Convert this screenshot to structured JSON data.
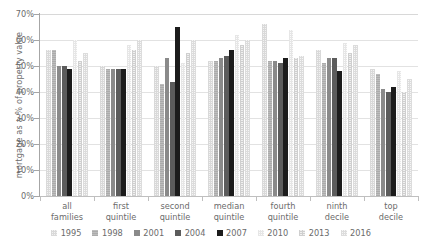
{
  "chart_data": {
    "type": "bar",
    "title": "",
    "xlabel": "",
    "ylabel": "mortgage as a % of property value",
    "ylim": [
      0,
      70
    ],
    "ytick_labels": [
      "70%",
      "60%",
      "50%",
      "40%",
      "30%",
      "20%",
      "10%",
      "0%"
    ],
    "ytick_values": [
      70,
      60,
      50,
      40,
      30,
      20,
      10,
      0
    ],
    "grid": true,
    "legend_position": "bottom",
    "categories": [
      "all families",
      "first quintile",
      "second quintile",
      "median quintile",
      "fourth quintile",
      "ninth decile",
      "top decile"
    ],
    "category_lines": [
      [
        "all",
        "families"
      ],
      [
        "first",
        "quintile"
      ],
      [
        "second",
        "quintile"
      ],
      [
        "median",
        "quintile"
      ],
      [
        "fourth",
        "quintile"
      ],
      [
        "ninth",
        "decile"
      ],
      [
        "top",
        "decile"
      ]
    ],
    "series": [
      {
        "name": "1995",
        "color": "#f2f2f2",
        "values": [
          56,
          50,
          50,
          52,
          66,
          56,
          49
        ]
      },
      {
        "name": "1998",
        "color": "#bdbdbd",
        "values": [
          56,
          49,
          43,
          52,
          52,
          51,
          47
        ]
      },
      {
        "name": "2001",
        "color": "#8a8a8a",
        "values": [
          50,
          49,
          53,
          53,
          52,
          53,
          41
        ]
      },
      {
        "name": "2004",
        "color": "#5c5c5c",
        "values": [
          50,
          49,
          44,
          54,
          51,
          53,
          40
        ]
      },
      {
        "name": "2007",
        "color": "#1c1c1c",
        "values": [
          49,
          49,
          65,
          56,
          53,
          48,
          42
        ]
      },
      {
        "name": "2010",
        "color": "#fafafa",
        "values": [
          60,
          58,
          51,
          62,
          64,
          59,
          48
        ]
      },
      {
        "name": "2013",
        "color": "#f0f0f0",
        "values": [
          52,
          56,
          55,
          58,
          53,
          55,
          40
        ]
      },
      {
        "name": "2016",
        "color": "#f6f6f6",
        "values": [
          55,
          60,
          60,
          60,
          54,
          58,
          45
        ]
      }
    ]
  },
  "axis": {
    "y_title": "mortgage as a % of property value"
  }
}
